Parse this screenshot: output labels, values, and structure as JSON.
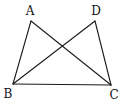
{
  "figure": {
    "points": {
      "A": {
        "label": "A",
        "x": 31,
        "y": 21,
        "lx": 30,
        "ly": 15
      },
      "D": {
        "label": "D",
        "x": 95,
        "y": 21,
        "lx": 96,
        "ly": 15
      },
      "B": {
        "label": "B",
        "x": 13,
        "y": 84,
        "lx": 7,
        "ly": 98
      },
      "C": {
        "label": "C",
        "x": 111,
        "y": 85,
        "lx": 113,
        "ly": 99
      }
    },
    "segments": [
      [
        "A",
        "B"
      ],
      [
        "A",
        "C"
      ],
      [
        "D",
        "B"
      ],
      [
        "D",
        "C"
      ],
      [
        "B",
        "C"
      ]
    ]
  }
}
